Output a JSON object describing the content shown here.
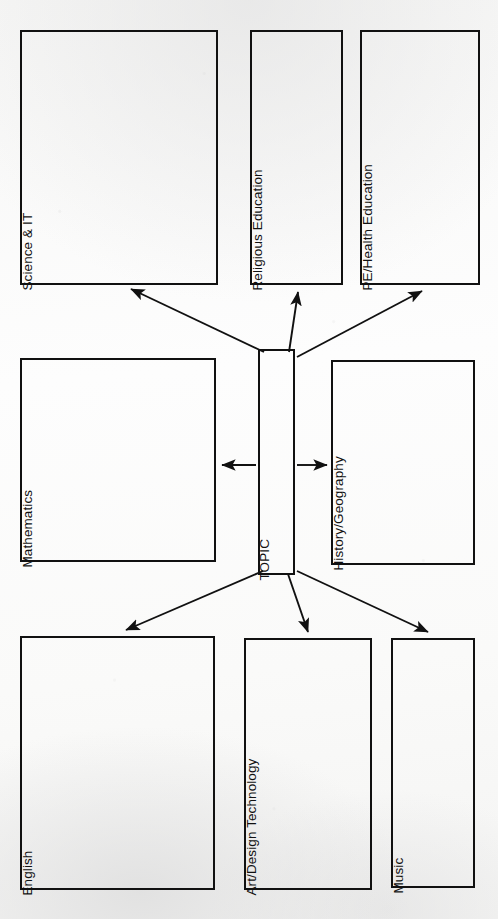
{
  "document": {
    "type": "topic-web-worksheet",
    "title": "TOPIC",
    "orientation": "landscape-scan-rotated",
    "background_color": "#fbfbfa",
    "ink_color": "#111111"
  },
  "center": {
    "label": "TOPIC",
    "x": 258,
    "y": 349,
    "w": 37,
    "h": 226
  },
  "boxes": [
    {
      "id": "science-it",
      "label": "Science & IT",
      "x": 20,
      "y": 30,
      "w": 198,
      "h": 255
    },
    {
      "id": "religious-education",
      "label": "Religious Education",
      "x": 250,
      "y": 30,
      "w": 93,
      "h": 255
    },
    {
      "id": "pe-health-education",
      "label": "PE/Health Education",
      "x": 360,
      "y": 30,
      "w": 120,
      "h": 255
    },
    {
      "id": "mathematics",
      "label": "Mathematics",
      "x": 20,
      "y": 358,
      "w": 196,
      "h": 204
    },
    {
      "id": "history-geography",
      "label": "History/Geography",
      "x": 331,
      "y": 360,
      "w": 144,
      "h": 205
    },
    {
      "id": "english",
      "label": "English",
      "x": 20,
      "y": 636,
      "w": 195,
      "h": 254
    },
    {
      "id": "art-design-technology",
      "label": "Art/Design Technology",
      "x": 244,
      "y": 638,
      "w": 128,
      "h": 252
    },
    {
      "id": "music",
      "label": "Music",
      "x": 391,
      "y": 638,
      "w": 84,
      "h": 250
    }
  ],
  "connectors": [
    {
      "id": "arrow-to-science-it",
      "from": "TOPIC",
      "to": "Science & IT",
      "direction": "up-left"
    },
    {
      "id": "arrow-to-religious-education",
      "from": "TOPIC",
      "to": "Religious Education",
      "direction": "up"
    },
    {
      "id": "arrow-to-pe-health-education",
      "from": "TOPIC",
      "to": "PE/Health Education",
      "direction": "up-right"
    },
    {
      "id": "arrow-to-mathematics",
      "from": "TOPIC",
      "to": "Mathematics",
      "direction": "left"
    },
    {
      "id": "arrow-to-history-geography",
      "from": "TOPIC",
      "to": "History/Geography",
      "direction": "right"
    },
    {
      "id": "arrow-to-english",
      "from": "TOPIC",
      "to": "English",
      "direction": "down-left"
    },
    {
      "id": "arrow-to-art-design-technology",
      "from": "TOPIC",
      "to": "Art/Design Technology",
      "direction": "down"
    },
    {
      "id": "arrow-to-music",
      "from": "TOPIC",
      "to": "Music",
      "direction": "down-right"
    }
  ]
}
